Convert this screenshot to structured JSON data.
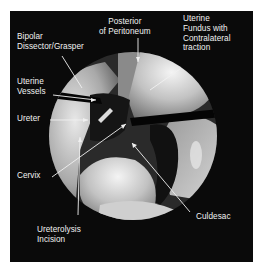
{
  "figure": {
    "type": "laparoscopic-view",
    "background_color": "#0a0a0a",
    "label_color": "#f2f2f2",
    "labels": {
      "posterior_peritoneum": "Posterior\nof Peritoneum",
      "uterine_fundus": "Uterine\nFundus with\nContralateral\ntraction",
      "bipolar": "Bipolar\nDissector/Grasper",
      "uterine_vessels": "Uterine\nVessels",
      "ureter": "Ureter",
      "cervix": "Cervix",
      "culdesac": "Culdesac",
      "ureterolysis": "Ureterolysis\nIncision"
    }
  }
}
